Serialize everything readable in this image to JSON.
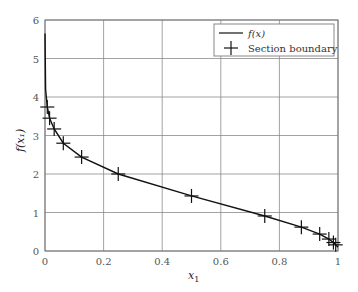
{
  "chart_data": {
    "type": "line",
    "title": "",
    "xlabel": "x1",
    "ylabel": "f(x1)",
    "xlim": [
      0,
      1
    ],
    "ylim": [
      0,
      6
    ],
    "grid": true,
    "legend_position": "upper right",
    "x_ticks": [
      "0",
      "0.2",
      "0.4",
      "0.6",
      "0.8",
      "1"
    ],
    "y_ticks": [
      "0",
      "1",
      "2",
      "3",
      "4",
      "5",
      "6"
    ],
    "series": [
      {
        "name": "f(x)",
        "style": "solid line",
        "x": [
          0.0,
          0.002,
          0.0078,
          0.0156,
          0.0313,
          0.0625,
          0.125,
          0.25,
          0.5,
          0.75,
          0.875,
          0.9375,
          0.9688,
          0.9844,
          0.9922,
          1.0
        ],
        "y": [
          5.65,
          4.2,
          3.74,
          3.45,
          3.17,
          2.8,
          2.44,
          2.0,
          1.43,
          0.91,
          0.62,
          0.44,
          0.31,
          0.22,
          0.16,
          0.1
        ]
      },
      {
        "name": "Section boundary",
        "style": "plus markers",
        "x": [
          0.0078,
          0.0156,
          0.0313,
          0.0625,
          0.125,
          0.25,
          0.5,
          0.75,
          0.875,
          0.9375,
          0.9688,
          0.9844,
          0.9922
        ],
        "y": [
          3.74,
          3.45,
          3.17,
          2.8,
          2.44,
          2.0,
          1.43,
          0.91,
          0.62,
          0.44,
          0.31,
          0.22,
          0.16
        ]
      }
    ]
  },
  "legend": {
    "line_label": "f(x)",
    "marker_label": "Section boundary"
  },
  "axes": {
    "xlabel_main": "x",
    "xlabel_sub": "1",
    "ylabel": "f(x₁)"
  }
}
